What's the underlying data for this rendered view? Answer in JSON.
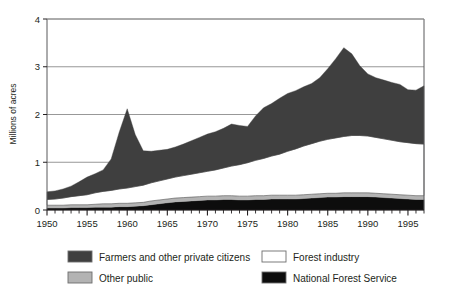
{
  "chart_data": {
    "type": "area",
    "stacked": true,
    "title": "",
    "subtitle": "",
    "xlabel": "",
    "ylabel": "Millions of acres",
    "xlim": [
      1950,
      1997
    ],
    "ylim": [
      0,
      4
    ],
    "yticks": [
      "0",
      "1",
      "2",
      "3",
      "4"
    ],
    "ytick_values": [
      0,
      1,
      2,
      3,
      4
    ],
    "xticks": [
      "1950",
      "1955",
      "1960",
      "1965",
      "1970",
      "1975",
      "1980",
      "1985",
      "1990",
      "1995"
    ],
    "xtick_values": [
      1950,
      1955,
      1960,
      1965,
      1970,
      1975,
      1980,
      1985,
      1990,
      1995
    ],
    "minor_xtick_interval": 1,
    "grid": "horizontal",
    "legend_position": "bottom",
    "x": [
      1950,
      1951,
      1952,
      1953,
      1954,
      1955,
      1956,
      1957,
      1958,
      1959,
      1960,
      1961,
      1962,
      1963,
      1964,
      1965,
      1966,
      1967,
      1968,
      1969,
      1970,
      1971,
      1972,
      1973,
      1974,
      1975,
      1976,
      1977,
      1978,
      1979,
      1980,
      1981,
      1982,
      1983,
      1984,
      1985,
      1986,
      1987,
      1988,
      1989,
      1990,
      1991,
      1992,
      1993,
      1994,
      1995,
      1996,
      1997
    ],
    "stack_order_bottom_to_top": [
      "National Forest Service",
      "Other public",
      "Forest industry",
      "Farmers and other private citizens"
    ],
    "series": [
      {
        "name": "National Forest Service",
        "color": "#0d0d0d",
        "values": [
          0.04,
          0.04,
          0.04,
          0.05,
          0.05,
          0.05,
          0.06,
          0.06,
          0.06,
          0.07,
          0.07,
          0.08,
          0.09,
          0.11,
          0.13,
          0.15,
          0.17,
          0.18,
          0.19,
          0.2,
          0.21,
          0.21,
          0.22,
          0.22,
          0.21,
          0.21,
          0.22,
          0.22,
          0.23,
          0.23,
          0.23,
          0.23,
          0.24,
          0.25,
          0.26,
          0.27,
          0.27,
          0.28,
          0.28,
          0.28,
          0.28,
          0.27,
          0.26,
          0.25,
          0.24,
          0.23,
          0.22,
          0.22
        ]
      },
      {
        "name": "Other public",
        "color": "#b3b3b3",
        "values": [
          0.06,
          0.06,
          0.06,
          0.06,
          0.06,
          0.06,
          0.06,
          0.07,
          0.07,
          0.07,
          0.07,
          0.07,
          0.07,
          0.08,
          0.08,
          0.08,
          0.08,
          0.08,
          0.08,
          0.08,
          0.08,
          0.08,
          0.08,
          0.08,
          0.08,
          0.08,
          0.08,
          0.08,
          0.08,
          0.08,
          0.08,
          0.08,
          0.08,
          0.08,
          0.08,
          0.08,
          0.08,
          0.08,
          0.08,
          0.08,
          0.08,
          0.08,
          0.08,
          0.08,
          0.08,
          0.08,
          0.08,
          0.08
        ]
      },
      {
        "name": "Forest industry",
        "color": "#ffffff",
        "values": [
          0.12,
          0.13,
          0.15,
          0.17,
          0.19,
          0.21,
          0.24,
          0.26,
          0.28,
          0.3,
          0.32,
          0.34,
          0.36,
          0.38,
          0.4,
          0.42,
          0.44,
          0.46,
          0.48,
          0.5,
          0.52,
          0.55,
          0.58,
          0.62,
          0.66,
          0.7,
          0.74,
          0.78,
          0.82,
          0.86,
          0.92,
          0.97,
          1.02,
          1.06,
          1.1,
          1.13,
          1.16,
          1.18,
          1.2,
          1.2,
          1.19,
          1.17,
          1.15,
          1.13,
          1.11,
          1.1,
          1.09,
          1.08
        ]
      },
      {
        "name": "Farmers and other private citizens",
        "color": "#3f3f3f",
        "values": [
          0.16,
          0.17,
          0.19,
          0.22,
          0.29,
          0.37,
          0.4,
          0.45,
          0.66,
          1.19,
          1.66,
          1.09,
          0.72,
          0.66,
          0.64,
          0.62,
          0.63,
          0.66,
          0.7,
          0.74,
          0.78,
          0.8,
          0.83,
          0.88,
          0.82,
          0.76,
          0.93,
          1.06,
          1.1,
          1.17,
          1.21,
          1.22,
          1.24,
          1.26,
          1.33,
          1.48,
          1.66,
          1.86,
          1.71,
          1.46,
          1.3,
          1.25,
          1.23,
          1.21,
          1.2,
          1.11,
          1.12,
          1.22
        ]
      }
    ],
    "totals": [
      0.38,
      0.4,
      0.44,
      0.5,
      0.59,
      0.69,
      0.76,
      0.84,
      1.07,
      1.63,
      2.12,
      1.58,
      1.24,
      1.23,
      1.25,
      1.27,
      1.32,
      1.38,
      1.45,
      1.52,
      1.59,
      1.64,
      1.71,
      1.8,
      1.77,
      1.75,
      1.97,
      2.14,
      2.23,
      2.34,
      2.44,
      2.5,
      2.58,
      2.65,
      2.77,
      2.96,
      3.17,
      3.4,
      3.27,
      3.02,
      2.85,
      2.77,
      2.72,
      2.67,
      2.63,
      2.52,
      2.51,
      2.6
    ],
    "annotations": [],
    "peaks": [
      {
        "year": 1960,
        "value": 2.12
      },
      {
        "year": 1987,
        "value": 3.4
      }
    ]
  },
  "axis": {
    "y_title": "Millions of acres"
  },
  "legend": {
    "items": [
      {
        "label": "Farmers and other private citizens",
        "color": "#3f3f3f"
      },
      {
        "label": "Forest industry",
        "color": "#ffffff"
      },
      {
        "label": "Other public",
        "color": "#b3b3b3"
      },
      {
        "label": "National Forest Service",
        "color": "#0d0d0d"
      }
    ]
  },
  "colors": {
    "farmers": "#3f3f3f",
    "other_public": "#b3b3b3",
    "forest_industry": "#ffffff",
    "national_forest_service": "#0d0d0d",
    "axis": "#58595b",
    "grid": "#8c8c8c",
    "text": "#231f20",
    "background": "#ffffff"
  }
}
